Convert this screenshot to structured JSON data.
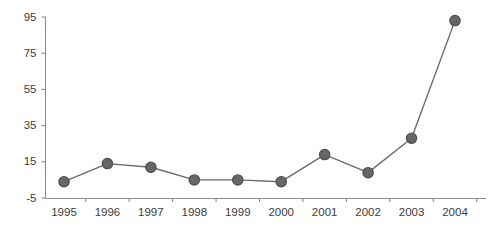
{
  "chart_data": {
    "type": "line",
    "title": "",
    "subtitle": "",
    "xlabel": "",
    "ylabel": "",
    "categories": [
      "1995",
      "1996",
      "1997",
      "1998",
      "1999",
      "2000",
      "2001",
      "2002",
      "2003",
      "2004"
    ],
    "values": [
      4,
      14,
      12,
      5,
      5,
      4,
      19,
      9,
      28,
      93
    ],
    "series": [
      {
        "name": "",
        "values": [
          4,
          14,
          12,
          5,
          5,
          4,
          19,
          9,
          28,
          93
        ]
      }
    ],
    "ylim": [
      -5,
      95
    ],
    "yticks": [
      -5,
      15,
      35,
      55,
      75,
      95
    ],
    "ytick_labels": [
      "-5",
      "15",
      "35",
      "55",
      "75",
      "95"
    ],
    "xtick_labels": [
      "1995",
      "1996",
      "1997",
      "1998",
      "1999",
      "2000",
      "2001",
      "2002",
      "2003",
      "2004"
    ],
    "grid": false,
    "legend": null,
    "marker": "circle",
    "colors": {
      "line": "#6b6b6b",
      "marker_fill": "#676767",
      "marker_stroke": "#4a4a4a",
      "axis": "#8c8c8c",
      "text": "#3c3c3c",
      "background": "#ffffff"
    }
  }
}
